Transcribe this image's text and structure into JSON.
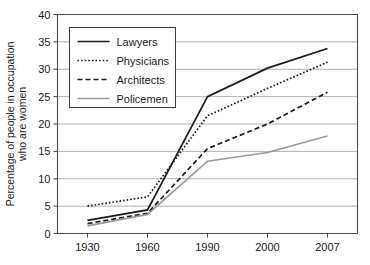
{
  "chart_data": {
    "type": "line",
    "title": "",
    "xlabel": "",
    "ylabel": "Percentage of people in occupation who are women",
    "ylabel_line1": "Percentage of people in occupation",
    "ylabel_line2": "who are women",
    "categories": [
      "1930",
      "1960",
      "1990",
      "2000",
      "2007"
    ],
    "x": [
      1930,
      1960,
      1990,
      2000,
      2007
    ],
    "ylim": [
      0,
      40
    ],
    "yticks": [
      0,
      5,
      10,
      15,
      20,
      25,
      30,
      35,
      40
    ],
    "ytick_labels": [
      "0",
      "5",
      "10",
      "15",
      "20",
      "25",
      "30",
      "35",
      "40"
    ],
    "xtick_labels": [
      "1930",
      "1960",
      "1990",
      "2000",
      "2007"
    ],
    "grid": "horizontal",
    "legend_position": "upper-left-inside",
    "series": [
      {
        "name": "Lawyers",
        "values": [
          2.4,
          4.3,
          25.0,
          30.2,
          33.8
        ],
        "style": "solid",
        "color": "#1a1a1a",
        "width": 1.7
      },
      {
        "name": "Physicians",
        "values": [
          5.0,
          6.7,
          21.5,
          26.5,
          31.3
        ],
        "style": "dotted",
        "color": "#1a1a1a",
        "width": 1.7
      },
      {
        "name": "Architects",
        "values": [
          1.8,
          3.7,
          15.5,
          20.0,
          25.8
        ],
        "style": "dashed",
        "color": "#1a1a1a",
        "width": 1.7
      },
      {
        "name": "Policemen",
        "values": [
          1.4,
          3.5,
          13.2,
          14.8,
          17.8
        ],
        "style": "solid",
        "color": "#9a9a9a",
        "width": 1.7
      }
    ]
  },
  "legend": {
    "entries": [
      {
        "label": "Lawyers"
      },
      {
        "label": "Physicians"
      },
      {
        "label": "Architects"
      },
      {
        "label": "Policemen"
      }
    ]
  },
  "axes": {
    "y_title_line1": "Percentage of people in occupation",
    "y_title_line2": "who are women",
    "y_ticks": [
      "0",
      "5",
      "10",
      "15",
      "20",
      "25",
      "30",
      "35",
      "40"
    ],
    "x_ticks": [
      "1930",
      "1960",
      "1990",
      "2000",
      "2007"
    ]
  },
  "colors": {
    "series_dark": "#1a1a1a",
    "series_gray": "#9a9a9a",
    "grid": "#a8a8a8",
    "axis": "#4a4a4a",
    "background": "#ffffff",
    "text": "#1c1c1c"
  }
}
